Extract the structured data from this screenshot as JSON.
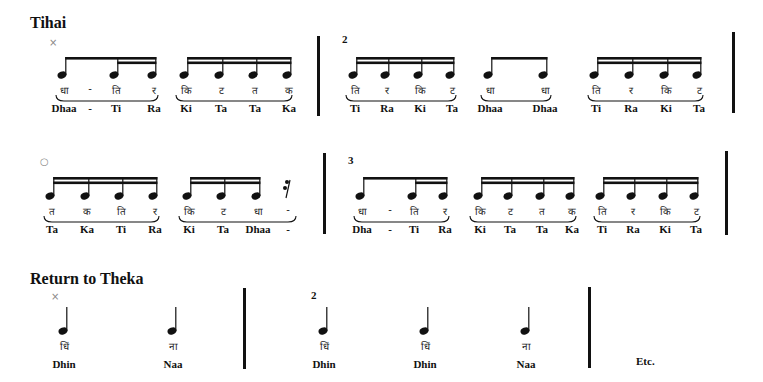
{
  "sections": {
    "tihai_title": "Tihai",
    "theka_title": "Return to Theka",
    "etc_label": "Etc."
  },
  "markers": {
    "row1_sam": "×",
    "row1_beat2": "2",
    "row2_khali": "○",
    "row2_beat3": "3",
    "row3_sam": "×",
    "row3_beat2": "2"
  },
  "colors": {
    "ink": "#111111",
    "marker": "#888888",
    "background": "#ffffff"
  },
  "rows": [
    {
      "name": "tihai-row-1",
      "noteY": 75,
      "beamY": 57,
      "devY": 87,
      "romY": 102,
      "groups": [
        {
          "beams": "8-16-16",
          "xs": [
            62,
            114,
            152
          ],
          "dev": [
            "धा",
            "-",
            "ति",
            "र"
          ],
          "devX": [
            62,
            88,
            114,
            152
          ],
          "rom": [
            "Dhaa",
            "-",
            "Ti",
            "Ra"
          ],
          "romX": [
            62,
            88,
            114,
            152
          ],
          "slur": [
            56,
            158
          ]
        },
        {
          "beams": "16",
          "xs": [
            184,
            219,
            253,
            287
          ],
          "dev": [
            "कि",
            "ट",
            "त",
            "क"
          ],
          "rom": [
            "Ki",
            "Ta",
            "Ta",
            "Ka"
          ],
          "slur": [
            176,
            292
          ]
        },
        {
          "beams": "16",
          "xs": [
            353,
            385,
            418,
            450
          ],
          "dev": [
            "ति",
            "र",
            "कि",
            "ट"
          ],
          "rom": [
            "Ti",
            "Ra",
            "Ki",
            "Ta"
          ],
          "slur": [
            346,
            456
          ]
        },
        {
          "beams": "8",
          "xs": [
            488,
            543
          ],
          "dev": [
            "धा",
            "धा"
          ],
          "rom": [
            "Dhaa",
            "Dhaa"
          ],
          "slur": [
            481,
            551
          ]
        },
        {
          "beams": "16",
          "xs": [
            594,
            629,
            664,
            697
          ],
          "dev": [
            "ति",
            "र",
            "कि",
            "ट"
          ],
          "rom": [
            "Ti",
            "Ra",
            "Ki",
            "Ta"
          ],
          "slur": [
            588,
            703
          ]
        }
      ]
    },
    {
      "name": "tihai-row-2",
      "noteY": 196,
      "beamY": 177,
      "devY": 208,
      "romY": 223,
      "groups": [
        {
          "beams": "16",
          "xs": [
            50,
            85,
            119,
            153
          ],
          "dev": [
            "त",
            "क",
            "ति",
            "र"
          ],
          "rom": [
            "Ta",
            "Ka",
            "Ti",
            "Ra"
          ],
          "slur": [
            44,
            159
          ]
        },
        {
          "beams": "16",
          "xs": [
            187,
            221,
            256
          ],
          "dev": [
            "कि",
            "ट",
            "धा"
          ],
          "rom": [
            "Ki",
            "Ta",
            "Dhaa"
          ],
          "devX": [
            187,
            221,
            256
          ],
          "romX": [
            187,
            221,
            256
          ],
          "slur": [
            179,
            296
          ]
        },
        {
          "beams": "8-16-16",
          "xs": [
            360,
            412,
            443
          ],
          "dev": [
            "धा",
            "-",
            "ति",
            "र"
          ],
          "devX": [
            360,
            388,
            412,
            443
          ],
          "rom": [
            "Dha",
            "-",
            "Ti",
            "Ra"
          ],
          "romX": [
            360,
            388,
            412,
            443
          ],
          "slur": [
            354,
            449
          ]
        },
        {
          "beams": "16",
          "xs": [
            478,
            508,
            540,
            570
          ],
          "dev": [
            "कि",
            "ट",
            "त",
            "क"
          ],
          "rom": [
            "Ki",
            "Ta",
            "Ta",
            "Ka"
          ],
          "slur": [
            470,
            576
          ]
        },
        {
          "beams": "16",
          "xs": [
            600,
            631,
            663,
            694
          ],
          "dev": [
            "ति",
            "र",
            "कि",
            "ट"
          ],
          "rom": [
            "Ti",
            "Ra",
            "Ki",
            "Ta"
          ],
          "slur": [
            594,
            700
          ]
        }
      ],
      "rest": {
        "x": 288,
        "dev": "-",
        "rom": "-"
      }
    }
  ],
  "theka": {
    "noteY": 331,
    "devY": 343,
    "romY": 358,
    "notes": [
      {
        "x": 63,
        "dev": "धिं",
        "rom": "Dhin"
      },
      {
        "x": 172,
        "dev": "ना",
        "rom": "Naa"
      },
      {
        "x": 323,
        "dev": "धिं",
        "rom": "Dhin"
      },
      {
        "x": 424,
        "dev": "धिं",
        "rom": "Dhin"
      },
      {
        "x": 525,
        "dev": "ना",
        "rom": "Naa"
      }
    ]
  }
}
